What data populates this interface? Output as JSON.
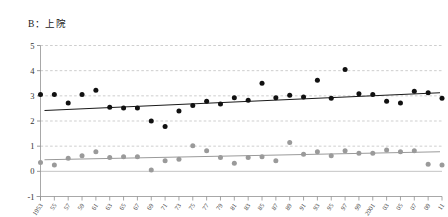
{
  "chart": {
    "title": "B：上院"
  },
  "chart_data": {
    "type": "scatter",
    "title": "B：上院",
    "xlabel": "",
    "ylabel": "",
    "ylim": [
      -1,
      5
    ],
    "xlim": [
      1953,
      2011
    ],
    "grid": true,
    "gridlines_y": [
      0,
      1,
      2,
      3,
      4,
      5
    ],
    "legend_position": "none",
    "y_ticks": [
      "5",
      "4",
      "3",
      "2",
      "1",
      "0",
      "-1"
    ],
    "y_tick_values": [
      5,
      4,
      3,
      2,
      1,
      0,
      -1
    ],
    "x_tick_labels": [
      "1953",
      "55",
      "57",
      "59",
      "61",
      "63",
      "65",
      "67",
      "69",
      "71",
      "73",
      "75",
      "77",
      "79",
      "81",
      "83",
      "85",
      "87",
      "89",
      "91",
      "93",
      "95",
      "97",
      "99",
      "2001",
      "03",
      "05",
      "07",
      "09",
      "11"
    ],
    "x": [
      1953,
      1955,
      1957,
      1959,
      1961,
      1963,
      1965,
      1967,
      1969,
      1971,
      1973,
      1975,
      1977,
      1979,
      1981,
      1983,
      1985,
      1987,
      1989,
      1991,
      1993,
      1995,
      1997,
      1999,
      2001,
      2003,
      2005,
      2007,
      2009,
      2011
    ],
    "series": [
      {
        "name": "black-series",
        "color": "#111111",
        "marker": "circle",
        "values": [
          3.05,
          3.05,
          2.72,
          3.05,
          3.22,
          2.55,
          2.52,
          2.52,
          2.0,
          1.78,
          2.4,
          2.62,
          2.78,
          2.68,
          2.92,
          2.82,
          3.5,
          2.92,
          3.02,
          2.95,
          3.62,
          2.9,
          4.05,
          3.08,
          3.05,
          2.78,
          2.72,
          3.18,
          3.12,
          2.9
        ]
      },
      {
        "name": "gray-series",
        "color": "#9a9a9a",
        "marker": "circle",
        "values": [
          0.35,
          0.25,
          0.52,
          0.62,
          0.78,
          0.55,
          0.58,
          0.58,
          0.05,
          0.42,
          0.48,
          1.02,
          0.82,
          0.55,
          0.32,
          0.55,
          0.58,
          0.42,
          1.15,
          0.68,
          0.78,
          0.62,
          0.82,
          0.72,
          0.72,
          0.85,
          0.78,
          0.82,
          0.28,
          0.25
        ]
      }
    ],
    "trendlines": [
      {
        "name": "black-trendline",
        "color": "#1a1a1a",
        "x_start": 1953,
        "x_end": 2011,
        "y_start": 2.42,
        "y_end": 3.12
      },
      {
        "name": "gray-trendline",
        "color": "#9a9a9a",
        "x_start": 1953,
        "x_end": 2011,
        "y_start": 0.46,
        "y_end": 0.78
      }
    ]
  }
}
